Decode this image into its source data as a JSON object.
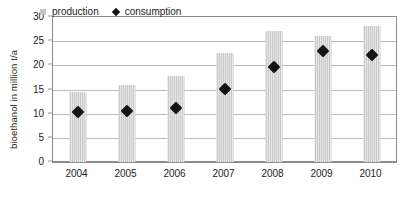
{
  "chart_data": {
    "type": "bar",
    "title": "",
    "subtitle": "",
    "xlabel": "",
    "ylabel": "bioethanol in million t/a",
    "categories": [
      "2004",
      "2005",
      "2006",
      "2007",
      "2008",
      "2009",
      "2010"
    ],
    "series": [
      {
        "name": "production",
        "marker": "bar",
        "color": "#c9c9c9",
        "values": [
          14.5,
          16.0,
          17.7,
          22.5,
          27.1,
          26.0,
          28.2
        ]
      },
      {
        "name": "consumption",
        "marker": "diamond",
        "color": "#141414",
        "values": [
          10.3,
          10.5,
          11.2,
          15.2,
          19.6,
          22.9,
          22.2
        ]
      }
    ],
    "ylim": [
      0,
      30
    ],
    "yticks": [
      0,
      5,
      10,
      15,
      20,
      25,
      30
    ],
    "ytick_labels": [
      "0",
      "5",
      "10",
      "15",
      "20",
      "25",
      "30"
    ],
    "grid": "horizontal",
    "legend_position": "top-left-inside"
  },
  "legend": {
    "items": [
      {
        "label": "production",
        "icon": "square-swatch-icon"
      },
      {
        "label": "consumption",
        "icon": "diamond-swatch-icon"
      }
    ]
  }
}
